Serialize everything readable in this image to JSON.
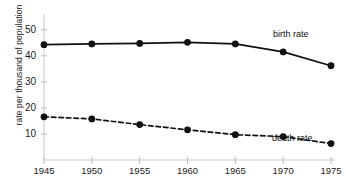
{
  "chart_data": {
    "type": "line",
    "title": "",
    "subtitle": "",
    "xlabel": "",
    "ylabel": "rate per thousand of population",
    "x": [
      1945,
      1950,
      1955,
      1960,
      1965,
      1970,
      1975
    ],
    "xticklabels": [
      "1945",
      "1950",
      "1955",
      "1960",
      "1965",
      "1970",
      "1975"
    ],
    "yticks": [
      10,
      20,
      30,
      40,
      50
    ],
    "yticklabels": [
      "10",
      "20",
      "30",
      "40",
      "50"
    ],
    "xlim": [
      1945,
      1975
    ],
    "ylim": [
      0,
      53
    ],
    "grid": false,
    "legend_position": "inline-right",
    "series": [
      {
        "name": "birth rate",
        "label": "birth rate",
        "linestyle": "solid",
        "marker": "circle",
        "color": "#111111",
        "values": [
          44.3,
          44.6,
          44.8,
          45.2,
          44.6,
          41.5,
          36.2
        ]
      },
      {
        "name": "death rate",
        "label": "death rate",
        "linestyle": "dashed",
        "marker": "circle",
        "color": "#111111",
        "values": [
          16.6,
          15.8,
          13.6,
          11.6,
          9.7,
          9.0,
          6.3
        ]
      }
    ]
  },
  "axes": {
    "axis_color": "#c9c9c9",
    "tick_color": "#b9b9b9",
    "text_color": "#222222",
    "background": "#ffffff"
  }
}
